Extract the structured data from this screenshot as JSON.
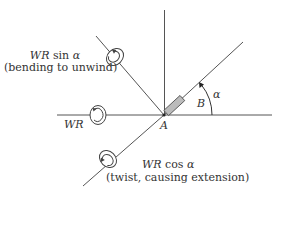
{
  "labels": {
    "wr_sin": {
      "wr": "WR",
      "func": " sin ",
      "alpha": "α"
    },
    "wr_sin_note": "(bending to unwind)",
    "wr": "WR",
    "wr_cos": {
      "wr": "WR",
      "func": " cos ",
      "alpha": "α"
    },
    "wr_cos_note": "(twist, causing extension)",
    "point_a": "A",
    "point_b": "B",
    "angle": "α"
  },
  "colors": {
    "line": "#555555",
    "text": "#333333",
    "rod_fill": "#bbbbbb"
  }
}
